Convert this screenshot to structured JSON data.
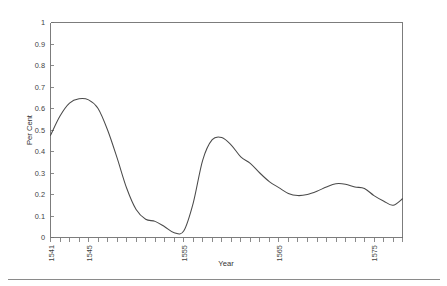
{
  "chart_data": {
    "type": "line",
    "title": "",
    "xlabel": "Year",
    "ylabel": "Per Cent",
    "xlim": [
      1541,
      1578
    ],
    "ylim": [
      0,
      1
    ],
    "grid": false,
    "legend": null,
    "x_tick_labels": [
      "1541",
      "1545",
      "1555",
      "1565",
      "1575"
    ],
    "x_tick_label_years": [
      1541,
      1545,
      1555,
      1565,
      1575
    ],
    "x_minor_tick_years": [
      1541,
      1542,
      1543,
      1544,
      1545,
      1546,
      1547,
      1548,
      1549,
      1550,
      1551,
      1552,
      1553,
      1554,
      1555,
      1556,
      1557,
      1558,
      1559,
      1560,
      1561,
      1562,
      1563,
      1564,
      1565,
      1566,
      1567,
      1568,
      1569,
      1570,
      1571,
      1572,
      1573,
      1574,
      1575,
      1576,
      1577,
      1578
    ],
    "y_tick_labels": [
      "0",
      "0.1",
      "0.2",
      "0.3",
      "0.4",
      "0.5",
      "0.6",
      "0.7",
      "0.8",
      "0.9",
      "1"
    ],
    "y_tick_values": [
      0,
      0.1,
      0.2,
      0.3,
      0.4,
      0.5,
      0.6,
      0.7,
      0.8,
      0.9,
      1
    ],
    "series": [
      {
        "name": "Per Cent",
        "color": "#4a4a4a",
        "x": [
          1541,
          1542,
          1543,
          1544,
          1545,
          1546,
          1547,
          1548,
          1549,
          1550,
          1551,
          1552,
          1553,
          1554,
          1555,
          1556,
          1557,
          1558,
          1559,
          1560,
          1561,
          1562,
          1563,
          1564,
          1565,
          1566,
          1567,
          1568,
          1569,
          1570,
          1571,
          1572,
          1573,
          1574,
          1575,
          1576,
          1577,
          1578
        ],
        "values": [
          0.475,
          0.565,
          0.625,
          0.645,
          0.64,
          0.6,
          0.5,
          0.37,
          0.23,
          0.13,
          0.085,
          0.075,
          0.05,
          0.022,
          0.03,
          0.16,
          0.36,
          0.455,
          0.465,
          0.43,
          0.375,
          0.345,
          0.3,
          0.26,
          0.232,
          0.205,
          0.195,
          0.2,
          0.215,
          0.235,
          0.25,
          0.248,
          0.235,
          0.228,
          0.195,
          0.17,
          0.15,
          0.18
        ]
      }
    ]
  },
  "axes": {
    "ylabel_text": "Per Cent",
    "xlabel_text": "Year"
  }
}
